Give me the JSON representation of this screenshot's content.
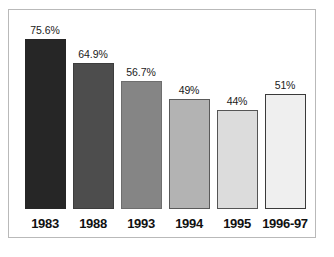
{
  "chart_data": {
    "type": "bar",
    "title": "",
    "subtitle": "",
    "xlabel": "",
    "ylabel": "",
    "categories": [
      "1983",
      "1988",
      "1993",
      "1994",
      "1995",
      "1996-97"
    ],
    "values": [
      75.6,
      64.9,
      56.7,
      49,
      44,
      51
    ],
    "value_labels": [
      "75.6%",
      "64.9%",
      "56.7%",
      "49%",
      "44%",
      "51%"
    ],
    "ylim": [
      0,
      80
    ],
    "grid": false,
    "legend": null,
    "axis_visible": false,
    "bar_colors": [
      "#262626",
      "#4d4d4d",
      "#858585",
      "#b3b3b3",
      "#dcdcdc",
      "#efefef"
    ],
    "bar_border_colors": [
      "#262626",
      "#3d3d3d",
      "#6e6e6e",
      "#5a5a5a",
      "#555555",
      "#3a3a3a"
    ],
    "frame_color": "#b9b9b9",
    "background_color": "#ffffff",
    "label_color": "#111111"
  },
  "figure": {
    "frame_label": "chart-frame",
    "background_label": "figure-background"
  }
}
